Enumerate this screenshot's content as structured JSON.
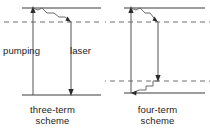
{
  "figure": {
    "type": "energy-level-diagram",
    "background_color": "#ffffff",
    "line_color": "#3c3c3c",
    "text_color": "#1b1b1b"
  },
  "panels": [
    {
      "id": "three-term",
      "caption_line1": "three-term",
      "caption_line2": "scheme",
      "levels": [
        {
          "name": "upper-pump-level",
          "style": "solid",
          "y": 8,
          "x1": 22,
          "x2": 101
        },
        {
          "name": "upper-laser-level",
          "style": "dashed",
          "y": 22,
          "x1": 4,
          "x2": 101
        },
        {
          "name": "ground-level",
          "style": "solid",
          "y": 95,
          "x1": 22,
          "x2": 101
        }
      ],
      "arrows": [
        {
          "name": "pumping-arrow",
          "x": 33,
          "y_from": 95,
          "y_to": 8,
          "head": "up",
          "label": "pumping"
        },
        {
          "name": "laser-arrow",
          "x": 71,
          "y_from": 22,
          "y_to": 95,
          "head": "down",
          "label": "laser"
        }
      ],
      "relaxations": [
        {
          "name": "nonradiative-decay",
          "from_x": 33,
          "from_y": 8,
          "to_x": 71,
          "to_y": 22,
          "style": "zigzag",
          "head": "down-right"
        }
      ],
      "labels": [
        {
          "name": "pumping-label",
          "text": "pumping"
        },
        {
          "name": "laser-label",
          "text": "laser"
        }
      ]
    },
    {
      "id": "four-term",
      "caption_line1": "four-term",
      "caption_line2": "scheme",
      "levels": [
        {
          "name": "upper-pump-level",
          "style": "solid",
          "y": 8,
          "x1": 19,
          "x2": 100
        },
        {
          "name": "upper-laser-level",
          "style": "dashed",
          "y": 22,
          "x1": 1,
          "x2": 104
        },
        {
          "name": "lower-laser-level",
          "style": "dashed",
          "y": 81,
          "x1": 1,
          "x2": 104
        },
        {
          "name": "ground-level",
          "style": "solid",
          "y": 93,
          "x1": 19,
          "x2": 100
        }
      ],
      "arrows": [
        {
          "name": "pumping-arrow",
          "x": 26,
          "y_from": 93,
          "y_to": 8,
          "head": "up",
          "label": "pumping"
        },
        {
          "name": "laser-arrow",
          "x": 53,
          "y_from": 22,
          "y_to": 81,
          "head": "down",
          "label": "laser"
        }
      ],
      "relaxations": [
        {
          "name": "upper-nonradiative-decay",
          "from_x": 26,
          "from_y": 8,
          "to_x": 53,
          "to_y": 22,
          "style": "zigzag",
          "head": "down-right"
        },
        {
          "name": "lower-nonradiative-decay",
          "from_x": 53,
          "from_y": 81,
          "to_x": 26,
          "to_y": 93,
          "style": "zigzag",
          "head": "down-left"
        }
      ],
      "labels": []
    }
  ]
}
